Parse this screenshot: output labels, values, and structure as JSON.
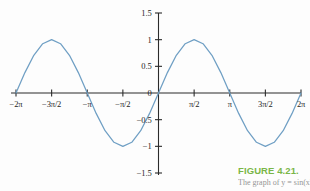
{
  "figure": {
    "caption_title": "FIGURE 4.21.",
    "caption_description": "The graph of y = sin(x).",
    "caption_color": "#7ab648",
    "background_color": "#fdfdfd"
  },
  "chart_data": {
    "type": "line",
    "title": "",
    "subtitle": "",
    "xlabel": "",
    "ylabel": "",
    "function": "y = sin(x)",
    "curve_color": "#6f9fc4",
    "axis_color": "#2b2b2b",
    "grid": false,
    "legend": false,
    "xlim": [
      -6.283185307,
      6.283185307
    ],
    "ylim": [
      -1.5,
      1.5
    ],
    "x_ticks": [
      {
        "value": -6.283185307,
        "label": "−2π"
      },
      {
        "value": -4.71238898,
        "label": "−3π/2"
      },
      {
        "value": -3.141592654,
        "label": "−π"
      },
      {
        "value": -1.570796327,
        "label": "−π/2"
      },
      {
        "value": 1.570796327,
        "label": "π/2"
      },
      {
        "value": 3.141592654,
        "label": "π"
      },
      {
        "value": 4.71238898,
        "label": "3π/2"
      },
      {
        "value": 6.283185307,
        "label": "2π"
      }
    ],
    "y_ticks": [
      {
        "value": 1.5,
        "label": "1.5"
      },
      {
        "value": 1.0,
        "label": "1"
      },
      {
        "value": 0.5,
        "label": "0.5"
      },
      {
        "value": 0.0,
        "label": "0"
      },
      {
        "value": -0.5,
        "label": "−0.5"
      },
      {
        "value": -1.0,
        "label": "−1"
      },
      {
        "value": -1.5,
        "label": "−1.5"
      }
    ],
    "key_points": [
      {
        "x": -6.283185307,
        "y": 0,
        "label": "zero at -2π"
      },
      {
        "x": -4.71238898,
        "y": 1,
        "label": "maximum at -3π/2"
      },
      {
        "x": -3.141592654,
        "y": 0,
        "label": "zero at -π"
      },
      {
        "x": -1.570796327,
        "y": -1,
        "label": "minimum at -π/2"
      },
      {
        "x": 0,
        "y": 0,
        "label": "zero at origin"
      },
      {
        "x": 1.570796327,
        "y": 1,
        "label": "maximum at π/2"
      },
      {
        "x": 3.141592654,
        "y": 0,
        "label": "zero at π"
      },
      {
        "x": 4.71238898,
        "y": -1,
        "label": "minimum at 3π/2"
      },
      {
        "x": 6.283185307,
        "y": 0,
        "label": "zero at 2π"
      }
    ],
    "series": [
      {
        "name": "sin(x)",
        "x": [
          -6.283185307,
          -5.890486225,
          -5.497787144,
          -5.105088062,
          -4.71238898,
          -4.319689899,
          -3.926990817,
          -3.534291735,
          -3.141592654,
          -2.748893572,
          -2.35619449,
          -1.963495408,
          -1.570796327,
          -1.178097245,
          -0.785398163,
          -0.392699082,
          0.0,
          0.392699082,
          0.785398163,
          1.178097245,
          1.570796327,
          1.963495408,
          2.35619449,
          2.748893572,
          3.141592654,
          3.534291735,
          3.926990817,
          4.319689899,
          4.71238898,
          5.105088062,
          5.497787144,
          5.890486225,
          6.283185307
        ],
        "y": [
          0.0,
          0.3827,
          0.7071,
          0.9239,
          1.0,
          0.9239,
          0.7071,
          0.3827,
          0.0,
          -0.3827,
          -0.7071,
          -0.9239,
          -1.0,
          -0.9239,
          -0.7071,
          -0.3827,
          0.0,
          0.3827,
          0.7071,
          0.9239,
          1.0,
          0.9239,
          0.7071,
          0.3827,
          0.0,
          -0.3827,
          -0.7071,
          -0.9239,
          -1.0,
          -0.9239,
          -0.7071,
          -0.3827,
          0.0
        ]
      }
    ]
  }
}
